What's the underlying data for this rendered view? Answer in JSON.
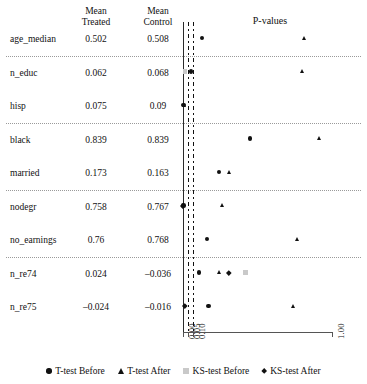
{
  "table": {
    "headers": {
      "covariate": "",
      "mean_treated": "Mean\nTreated",
      "mean_control": "Mean\nControl"
    },
    "rows": [
      {
        "covariate": "age_median",
        "mean_treated": "0.502",
        "mean_control": "0.508"
      },
      {
        "covariate": "n_educ",
        "mean_treated": "0.062",
        "mean_control": "0.068"
      },
      {
        "covariate": "hisp",
        "mean_treated": "0.075",
        "mean_control": "0.09"
      },
      {
        "covariate": "black",
        "mean_treated": "0.839",
        "mean_control": "0.839"
      },
      {
        "covariate": "married",
        "mean_treated": "0.173",
        "mean_control": "0.163"
      },
      {
        "covariate": "nodegr",
        "mean_treated": "0.758",
        "mean_control": "0.767"
      },
      {
        "covariate": "no_earnings",
        "mean_treated": "0.76",
        "mean_control": "0.768"
      },
      {
        "covariate": "n_re74",
        "mean_treated": "0.024",
        "mean_control": "–0.036"
      },
      {
        "covariate": "n_re75",
        "mean_treated": "–0.024",
        "mean_control": "–0.016"
      }
    ]
  },
  "chart_data": {
    "type": "scatter",
    "title": "P-values",
    "xlabel": "",
    "ylabel": "",
    "xticks": [
      "0.00",
      "0.05",
      "0.10",
      "1.00"
    ],
    "xtick_values": [
      0.0,
      0.05,
      0.1,
      1.0
    ],
    "xlim": [
      0.0,
      1.0
    ],
    "grid": false,
    "reference_lines": [
      0.05,
      0.1
    ],
    "legend_position": "bottom",
    "categories": [
      "age_median",
      "n_educ",
      "hisp",
      "black",
      "married",
      "nodegr",
      "no_earnings",
      "n_re74",
      "n_re75"
    ],
    "series": [
      {
        "name": "T-test Before",
        "marker": "circle",
        "color": "#111111",
        "values": [
          0.16,
          0.08,
          0.005,
          0.47,
          0.27,
          0.003,
          0.19,
          0.14,
          0.2
        ]
      },
      {
        "name": "T-test After",
        "marker": "triangle",
        "color": "#111111",
        "values": [
          0.82,
          0.81,
          0.015,
          0.92,
          0.34,
          0.29,
          0.78,
          0.27,
          0.75
        ]
      },
      {
        "name": "KS-test Before",
        "marker": "square",
        "color": "#c9c9c9",
        "values": [
          null,
          0.02,
          null,
          null,
          null,
          null,
          null,
          0.44,
          null
        ]
      },
      {
        "name": "KS-test After",
        "marker": "diamond",
        "color": "#111111",
        "values": [
          null,
          null,
          null,
          null,
          null,
          0.001,
          null,
          0.33,
          0.02
        ]
      }
    ]
  },
  "legend": {
    "items": [
      {
        "label": "T-test Before",
        "marker": "circle",
        "color": "#111111"
      },
      {
        "label": "T-test After",
        "marker": "triangle",
        "color": "#111111"
      },
      {
        "label": "KS-test Before",
        "marker": "square",
        "color": "#c9c9c9"
      },
      {
        "label": "KS-test After",
        "marker": "diamond",
        "color": "#111111"
      }
    ]
  }
}
